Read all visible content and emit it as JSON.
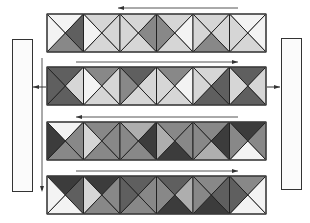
{
  "diagram": {
    "title": "",
    "palette": {
      "W": "#f3f3f3",
      "L": "#d6d6d6",
      "M": "#aeaeae",
      "G": "#888888",
      "D": "#5f5f5f",
      "K": "#3c3c3c"
    },
    "stroke_color": "#222222",
    "strip_geometry": {
      "x": 47,
      "width": 219,
      "height": 38,
      "squares": 6
    },
    "strips": [
      {
        "id": "strip-1",
        "y": 14,
        "arrow_direction": "left",
        "arrow_y": 8,
        "arrow_x1": 118,
        "arrow_x2": 238,
        "squares": [
          {
            "T": "W",
            "R": "D",
            "B": "G",
            "L": "W"
          },
          {
            "T": "L",
            "R": "L",
            "B": "L",
            "L": "W"
          },
          {
            "T": "L",
            "R": "G",
            "B": "L",
            "L": "L"
          },
          {
            "T": "L",
            "R": "W",
            "B": "L",
            "L": "G"
          },
          {
            "T": "L",
            "R": "L",
            "B": "G",
            "L": "L"
          },
          {
            "T": "W",
            "R": "W",
            "B": "L",
            "L": "L"
          }
        ]
      },
      {
        "id": "strip-2",
        "y": 67,
        "arrow_direction": "right",
        "arrow_y": 62,
        "arrow_x1": 76,
        "arrow_x2": 238,
        "squares": [
          {
            "T": "D",
            "R": "L",
            "B": "D",
            "L": "D"
          },
          {
            "T": "G",
            "R": "L",
            "B": "L",
            "L": "W"
          },
          {
            "T": "D",
            "R": "L",
            "B": "L",
            "L": "G"
          },
          {
            "T": "G",
            "R": "W",
            "B": "L",
            "L": "L"
          },
          {
            "T": "L",
            "R": "D",
            "B": "D",
            "L": "L"
          },
          {
            "T": "D",
            "R": "L",
            "B": "D",
            "L": "L"
          }
        ]
      },
      {
        "id": "strip-3",
        "y": 122,
        "arrow_direction": "left",
        "arrow_y": 117,
        "arrow_x1": 76,
        "arrow_x2": 238,
        "squares": [
          {
            "T": "W",
            "R": "G",
            "B": "G",
            "L": "K"
          },
          {
            "T": "G",
            "R": "G",
            "B": "G",
            "L": "L"
          },
          {
            "T": "M",
            "R": "K",
            "B": "G",
            "L": "G"
          },
          {
            "T": "G",
            "R": "G",
            "B": "K",
            "L": "M"
          },
          {
            "T": "G",
            "R": "K",
            "B": "M",
            "L": "G"
          },
          {
            "T": "K",
            "R": "G",
            "B": "W",
            "L": "G"
          }
        ]
      },
      {
        "id": "strip-4",
        "y": 176,
        "arrow_direction": "right",
        "arrow_y": 171,
        "arrow_x1": 76,
        "arrow_x2": 238,
        "squares": [
          {
            "T": "K",
            "R": "D",
            "B": "W",
            "L": "W"
          },
          {
            "T": "K",
            "R": "G",
            "B": "G",
            "L": "L"
          },
          {
            "T": "D",
            "R": "G",
            "B": "G",
            "L": "D"
          },
          {
            "T": "D",
            "R": "M",
            "B": "K",
            "L": "G"
          },
          {
            "T": "G",
            "R": "D",
            "B": "K",
            "L": "G"
          },
          {
            "T": "G",
            "R": "W",
            "B": "W",
            "L": "D"
          }
        ]
      }
    ],
    "side_boxes": [
      {
        "id": "left-box",
        "x": 12,
        "y": 39,
        "width": 20,
        "height": 152
      },
      {
        "id": "right-box",
        "x": 281,
        "y": 38,
        "width": 20,
        "height": 151
      }
    ],
    "connectors": {
      "left_vertical_line": {
        "x": 42,
        "y1": 58,
        "y2": 190,
        "arrow": "down"
      },
      "left_horizontal_arrow": {
        "y": 87,
        "x1": 46,
        "x2": 33,
        "arrow": "left"
      },
      "right_horizontal_arrow": {
        "y": 87,
        "x1": 267,
        "x2": 280,
        "arrow": "right"
      }
    }
  }
}
